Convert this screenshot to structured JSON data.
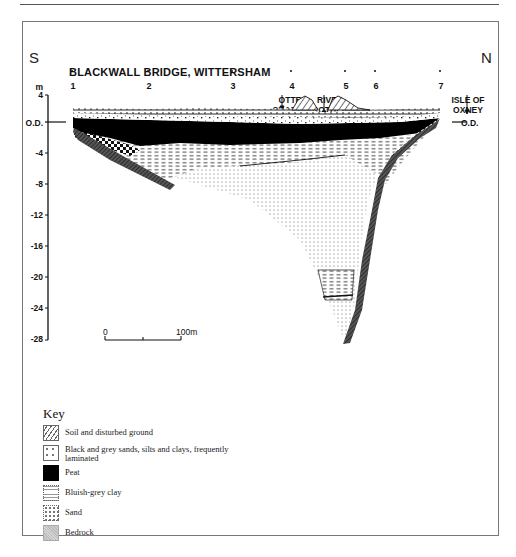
{
  "page": {
    "running_header_marks": ""
  },
  "figure": {
    "direction_left": "S",
    "direction_right": "N",
    "title": "BLACKWALL BRIDGE, WITTERSHAM",
    "boreholes": [
      {
        "label": "1",
        "x": 72
      },
      {
        "label": "2",
        "x": 148
      },
      {
        "label": "3",
        "x": 232
      },
      {
        "label": "4",
        "x": 291
      },
      {
        "label": "5",
        "x": 345
      },
      {
        "label": "6",
        "x": 375
      },
      {
        "label": "7",
        "x": 440
      }
    ],
    "places": [
      {
        "label_line1": "OTTER",
        "label_line2": "CHANNEL",
        "x": 282
      },
      {
        "label_line1": "RIVER",
        "label_line2": "ROTHER",
        "x": 324
      },
      {
        "label_line1": "ISLE OF",
        "label_line2": "OXNEY",
        "x": 465
      }
    ],
    "axis": {
      "unit": "m",
      "ticks": [
        {
          "label": "4",
          "value": 4
        },
        {
          "label": "O.D.",
          "value": 0
        },
        {
          "label": "-4",
          "value": -4
        },
        {
          "label": "-8",
          "value": -8
        },
        {
          "label": "-12",
          "value": -12
        },
        {
          "label": "-16",
          "value": -16
        },
        {
          "label": "-20",
          "value": -20
        },
        {
          "label": "-24",
          "value": -24
        },
        {
          "label": "-28",
          "value": -28
        }
      ],
      "right_label": "O.D."
    },
    "scale_bar": {
      "start_label": "0",
      "end_label": "100m"
    }
  },
  "legend": {
    "title": "Key",
    "items": [
      {
        "id": "soil",
        "label": "Soil and disturbed ground"
      },
      {
        "id": "sands",
        "label": "Black and grey sands, silts and clays, frequently laminated"
      },
      {
        "id": "peat",
        "label": "Peat"
      },
      {
        "id": "clay",
        "label": "Bluish-grey clay"
      },
      {
        "id": "sand",
        "label": "Sand"
      },
      {
        "id": "bedrock",
        "label": "Bedrock"
      }
    ]
  }
}
